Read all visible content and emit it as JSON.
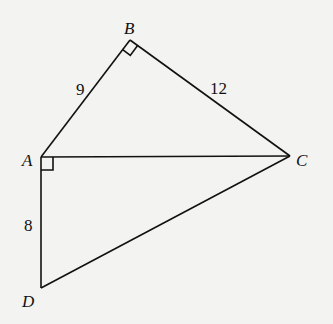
{
  "diagram": {
    "points": {
      "A": {
        "label": "A",
        "x": 41,
        "y": 157,
        "lx": 23,
        "ly": 166
      },
      "B": {
        "label": "B",
        "x": 130,
        "y": 40,
        "lx": 124,
        "ly": 34
      },
      "C": {
        "label": "C",
        "x": 290,
        "y": 156,
        "lx": 296,
        "ly": 166
      },
      "D": {
        "label": "D",
        "x": 41,
        "y": 288,
        "lx": 23,
        "ly": 307
      }
    },
    "segments": [
      {
        "from": "A",
        "to": "B",
        "label": "9",
        "lx": 76,
        "ly": 95
      },
      {
        "from": "B",
        "to": "C",
        "label": "12",
        "lx": 212,
        "ly": 94
      },
      {
        "from": "A",
        "to": "C",
        "label": ""
      },
      {
        "from": "A",
        "to": "D",
        "label": "8",
        "lx": 24,
        "ly": 231
      },
      {
        "from": "D",
        "to": "C",
        "label": ""
      }
    ],
    "right_angles": [
      "B",
      "A"
    ],
    "colors": {
      "line": "#111111",
      "background": "#f3f3f1"
    }
  }
}
